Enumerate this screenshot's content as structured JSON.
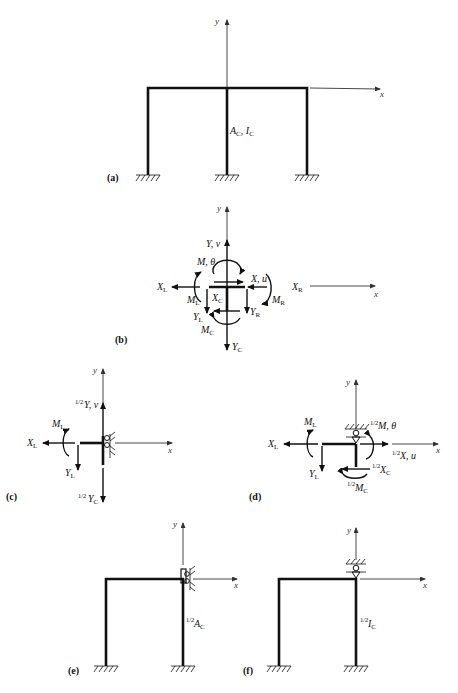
{
  "figure": {
    "panels": [
      {
        "id": "a",
        "tag": "(a)",
        "label_member": "A",
        "label_member_sub": "C",
        "label_member2": ", I",
        "label_member2_sub": "C",
        "axis_x": "x",
        "axis_y": "y"
      },
      {
        "id": "b",
        "tag": "(b)",
        "axis_x": "x",
        "axis_y": "y",
        "labels": {
          "Yv": "Y, v",
          "Mtheta": "M, θ",
          "Xu": "X, u",
          "XL": "X",
          "XL_sub": "L",
          "XR": "X",
          "XR_sub": "R",
          "ML": "M",
          "ML_sub": "L",
          "MR": "M",
          "MR_sub": "R",
          "XC": "X",
          "XC_sub": "C",
          "YL": "Y",
          "YL_sub": "L",
          "YR": "Y",
          "YR_sub": "R",
          "MC": "M",
          "MC_sub": "C",
          "YC": "Y",
          "YC_sub": "C"
        }
      },
      {
        "id": "c",
        "tag": "(c)",
        "axis_x": "x",
        "axis_y": "y",
        "labels": {
          "half": "1/2",
          "Yv": "Y, v",
          "ML": "M",
          "ML_sub": "L",
          "XL": "X",
          "XL_sub": "L",
          "YL": "Y",
          "YL_sub": "L",
          "YC": "Y",
          "YC_sub": "C"
        }
      },
      {
        "id": "d",
        "tag": "(d)",
        "axis_x": "x",
        "axis_y": "y",
        "labels": {
          "half": "1/2",
          "Mtheta": "M, θ",
          "ML": "M",
          "ML_sub": "L",
          "XL": "X",
          "XL_sub": "L",
          "Xu": "X, u",
          "YL": "Y",
          "YL_sub": "L",
          "XC": "X",
          "XC_sub": "C",
          "MC": "M",
          "MC_sub": "C"
        }
      },
      {
        "id": "e",
        "tag": "(e)",
        "axis_x": "x",
        "axis_y": "y",
        "half": "1/2",
        "label_member": "A",
        "label_member_sub": "C"
      },
      {
        "id": "f",
        "tag": "(f)",
        "axis_x": "x",
        "axis_y": "y",
        "half": "1/2",
        "label_member": "I",
        "label_member_sub": "C"
      }
    ]
  }
}
